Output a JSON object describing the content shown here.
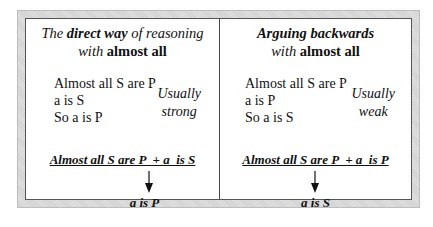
{
  "panels": [
    {
      "title_line1_pre": "The ",
      "title_line1_bold": "direct way",
      "title_line1_post": " of reasoning",
      "title_line2_pre": "with ",
      "title_line2_bold": "almost all",
      "argument": [
        "Almost all S are P",
        "a is S",
        "So a is P"
      ],
      "strength_line1": "Usually",
      "strength_line2": "strong",
      "premise": "Almost all S are P  + a  is S",
      "conclusion": "a is P"
    },
    {
      "title_line1_pre": "",
      "title_line1_bold": "Arguing backwards",
      "title_line1_post": "",
      "title_line2_pre": "with ",
      "title_line2_bold": "almost all",
      "argument": [
        "Almost all S are P",
        "a is P",
        "So a is S"
      ],
      "strength_line1": "Usually",
      "strength_line2": "weak",
      "premise": "Almost all S are P  + a  is P",
      "conclusion": "a is S"
    }
  ]
}
